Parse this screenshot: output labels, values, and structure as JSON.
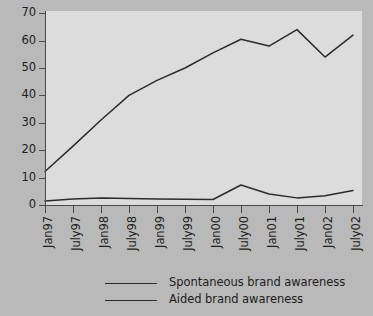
{
  "chart_data": {
    "type": "line",
    "title": "",
    "xlabel": "",
    "ylabel": "",
    "ylim": [
      0,
      70
    ],
    "yticks": [
      0,
      10,
      20,
      30,
      40,
      50,
      60,
      70
    ],
    "grid": false,
    "legend_position": "bottom",
    "categories": [
      "Jan97",
      "July97",
      "Jan98",
      "July98",
      "Jan99",
      "July99",
      "Jan00",
      "July00",
      "Jan01",
      "July01",
      "Jan02",
      "July02"
    ],
    "series": [
      {
        "name": "Spontaneous brand awareness",
        "color": "#2b2b2b",
        "values": [
          1.5,
          2.2,
          2.6,
          2.4,
          2.2,
          2.1,
          2.0,
          7.3,
          4.0,
          2.6,
          3.4,
          5.3
        ]
      },
      {
        "name": "Aided brand awareness",
        "color": "#2b2b2b",
        "values": [
          12.2,
          21.5,
          31.0,
          40.0,
          45.5,
          50.0,
          55.5,
          60.5,
          58.0,
          64.0,
          54.0,
          62.0
        ]
      }
    ]
  },
  "axis": {
    "y_tick_labels": [
      "0",
      "10",
      "20",
      "30",
      "40",
      "50",
      "60",
      "70"
    ],
    "x_tick_labels": [
      "Jan97",
      "July97",
      "Jan98",
      "July98",
      "Jan99",
      "July99",
      "Jan00",
      "July00",
      "Jan01",
      "July01",
      "Jan02",
      "July02"
    ]
  },
  "legend": {
    "items": [
      {
        "label": "Spontaneous brand awareness"
      },
      {
        "label": "Aided brand awareness"
      }
    ]
  },
  "colors": {
    "page_background": "#b9b9b9",
    "plot_background": "#dcdcdc",
    "line": "#2b2b2b",
    "axis": "#4a4a4a",
    "text": "#1c1c1c"
  }
}
